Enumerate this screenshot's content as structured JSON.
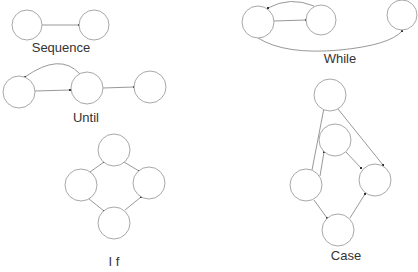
{
  "diagrams": {
    "sequence": {
      "label": "Sequence",
      "nodes": [
        {
          "x": 27,
          "y": 25,
          "r": 15
        },
        {
          "x": 94,
          "y": 25,
          "r": 15
        }
      ],
      "label_pos": {
        "x": 61,
        "y": 52
      }
    },
    "while": {
      "label": "While",
      "nodes": [
        {
          "x": 258,
          "y": 22,
          "r": 16
        },
        {
          "x": 321,
          "y": 20,
          "r": 15
        },
        {
          "x": 402,
          "y": 15,
          "r": 15
        }
      ],
      "label_pos": {
        "x": 340,
        "y": 63
      }
    },
    "until": {
      "label": "Until",
      "nodes": [
        {
          "x": 19,
          "y": 92,
          "r": 16
        },
        {
          "x": 87,
          "y": 88,
          "r": 16
        },
        {
          "x": 150,
          "y": 87,
          "r": 16
        }
      ],
      "label_pos": {
        "x": 86,
        "y": 122
      }
    },
    "if": {
      "label": "I f",
      "nodes": [
        {
          "x": 114,
          "y": 150,
          "r": 16
        },
        {
          "x": 81,
          "y": 185,
          "r": 16
        },
        {
          "x": 149,
          "y": 183,
          "r": 16
        },
        {
          "x": 114,
          "y": 223,
          "r": 16
        }
      ],
      "label_pos": {
        "x": 114,
        "y": 266
      }
    },
    "case": {
      "label": "Case",
      "nodes": [
        {
          "x": 330,
          "y": 95,
          "r": 16
        },
        {
          "x": 335,
          "y": 140,
          "r": 16
        },
        {
          "x": 306,
          "y": 185,
          "r": 16
        },
        {
          "x": 375,
          "y": 180,
          "r": 16
        },
        {
          "x": 338,
          "y": 230,
          "r": 16
        }
      ],
      "label_pos": {
        "x": 346,
        "y": 260
      }
    }
  },
  "colors": {
    "node_stroke": "#a8a8a8",
    "edge": "#8c8c8c",
    "text": "#333333",
    "background": "#ffffff"
  }
}
